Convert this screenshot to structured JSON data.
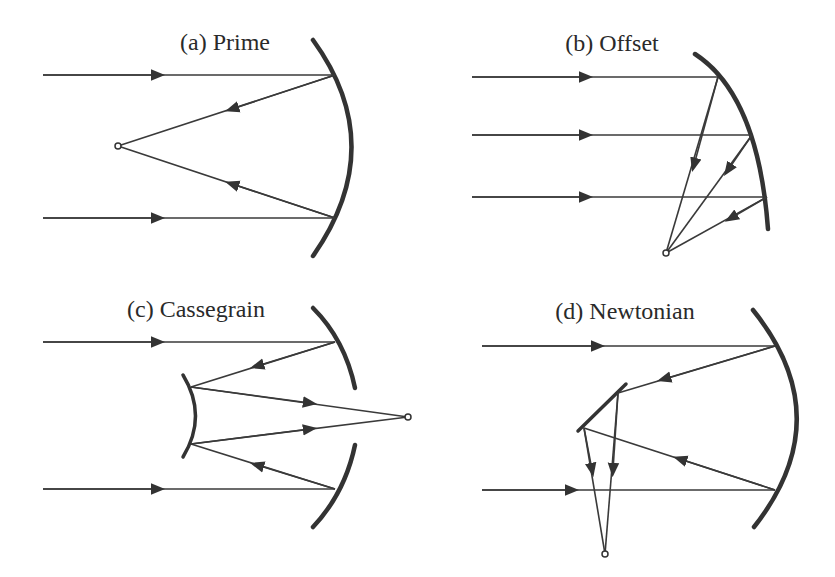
{
  "figure": {
    "panels": [
      {
        "id": "a",
        "label": "(a) Prime"
      },
      {
        "id": "b",
        "label": "(b) Offset"
      },
      {
        "id": "c",
        "label": "(c) Cassegrain"
      },
      {
        "id": "d",
        "label": "(d) Newtonian"
      }
    ],
    "colors": {
      "line": "#333333",
      "background": "#ffffff"
    }
  }
}
